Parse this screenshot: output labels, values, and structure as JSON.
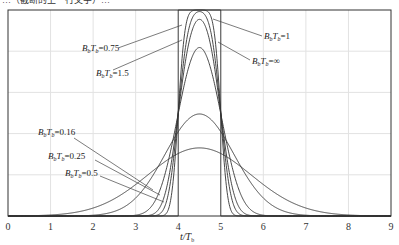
{
  "header_fragment": "…（截断的上一行文字）…",
  "chart_data": {
    "type": "line",
    "title": "",
    "xlabel": "t/Tb",
    "xlabel_main": "t/T",
    "xlabel_sub": "b",
    "ylabel": "",
    "xlim": [
      0,
      9
    ],
    "ylim": [
      0,
      1
    ],
    "xticks": [
      "0",
      "1",
      "2",
      "3",
      "4",
      "5",
      "6",
      "7",
      "8",
      "9"
    ],
    "yticks": [],
    "grid": true,
    "grid_y_fractions": [
      0.2,
      0.4,
      0.6,
      0.8
    ],
    "pulse_start": 4,
    "pulse_end": 5,
    "series": [
      {
        "name": "BbTb=∞",
        "bt": null,
        "label": {
          "pre": "B",
          "sub1": "b",
          "mid": "T",
          "sub2": "b",
          "val": "=∞"
        },
        "peak": 1.0
      },
      {
        "name": "BbTb=1.5",
        "bt": 1.5,
        "label": {
          "pre": "B",
          "sub1": "b",
          "mid": "T",
          "sub2": "b",
          "val": "=1.5"
        },
        "peak": 1.0
      },
      {
        "name": "BbTb=1",
        "bt": 1,
        "label": {
          "pre": "B",
          "sub1": "b",
          "mid": "T",
          "sub2": "b",
          "val": "=1"
        },
        "peak": 0.9998
      },
      {
        "name": "BbTb=0.75",
        "bt": 0.75,
        "label": {
          "pre": "B",
          "sub1": "b",
          "mid": "T",
          "sub2": "b",
          "val": "=0.75"
        },
        "peak": 0.995
      },
      {
        "name": "BbTb=0.5",
        "bt": 0.5,
        "label": {
          "pre": "B",
          "sub1": "b",
          "mid": "T",
          "sub2": "b",
          "val": "=0.5"
        },
        "peak": 0.94
      },
      {
        "name": "BbTb=0.25",
        "bt": 0.25,
        "label": {
          "pre": "B",
          "sub1": "b",
          "mid": "T",
          "sub2": "b",
          "val": "=0.25"
        },
        "peak": 0.65
      },
      {
        "name": "BbTb=0.16",
        "bt": 0.16,
        "label": {
          "pre": "B",
          "sub1": "b",
          "mid": "T",
          "sub2": "b",
          "val": "=0.16"
        },
        "peak": 0.45
      }
    ]
  }
}
